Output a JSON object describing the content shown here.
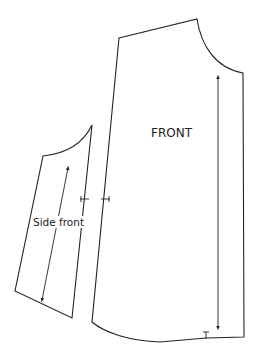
{
  "diagram": {
    "type": "sewing-pattern",
    "stroke_color": "#222222",
    "background": "#ffffff",
    "pieces": [
      {
        "id": "front",
        "label": "FRONT",
        "grainline": "vertical arrow, double-headed",
        "notches": [
          "side seam notch",
          "hem notch"
        ]
      },
      {
        "id": "side-front",
        "label": "Side front",
        "grainline": "diagonal arrow, double-headed",
        "notches": [
          "side seam notch"
        ]
      }
    ]
  }
}
